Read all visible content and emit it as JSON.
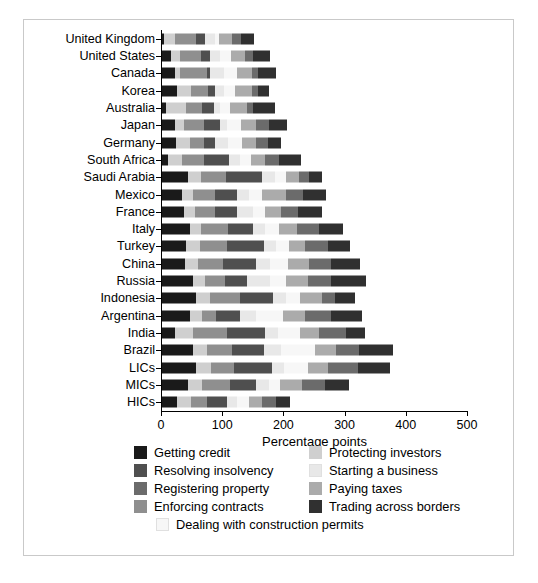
{
  "chart_data": {
    "type": "bar",
    "orientation": "horizontal",
    "stacked": true,
    "title": "",
    "xlabel": "Percentage points",
    "ylabel": "",
    "xlim": [
      0,
      520
    ],
    "xticks": [
      0,
      100,
      200,
      300,
      400,
      500
    ],
    "grid": false,
    "legend_position": "below",
    "categories": [
      "United Kingdom",
      "United States",
      "Canada",
      "Korea",
      "Australia",
      "Japan",
      "Germany",
      "South Africa",
      "Saudi Arabia",
      "Mexico",
      "France",
      "Italy",
      "Turkey",
      "China",
      "Russia",
      "Indonesia",
      "Argentina",
      "India",
      "Brazil",
      "LICs",
      "MICs",
      "HICs"
    ],
    "series": [
      {
        "name": "Getting credit",
        "color": "#1a1a1a",
        "values": [
          4,
          14,
          22,
          24,
          6,
          22,
          23,
          10,
          42,
          33,
          36,
          45,
          40,
          37,
          50,
          55,
          46,
          22,
          50,
          56,
          43,
          24
        ]
      },
      {
        "name": "Protecting investors",
        "color": "#cfcfcf",
        "values": [
          18,
          16,
          8,
          24,
          34,
          14,
          23,
          22,
          22,
          17,
          18,
          18,
          22,
          22,
          20,
          23,
          20,
          28,
          24,
          24,
          22,
          23
        ]
      },
      {
        "name": "Enforcing contracts",
        "color": "#8f8f8f",
        "values": [
          33,
          33,
          43,
          27,
          25,
          32,
          22,
          36,
          40,
          36,
          33,
          45,
          44,
          40,
          33,
          49,
          22,
          56,
          40,
          37,
          46,
          27
        ]
      },
      {
        "name": "Resolving insolvency",
        "color": "#4f4f4f",
        "values": [
          16,
          16,
          6,
          12,
          20,
          26,
          18,
          42,
          60,
          36,
          35,
          40,
          60,
          54,
          36,
          54,
          40,
          62,
          52,
          62,
          42,
          33
        ]
      },
      {
        "name": "Starting a business",
        "color": "#e8e8e8",
        "values": [
          16,
          16,
          22,
          14,
          10,
          13,
          22,
          17,
          20,
          20,
          26,
          20,
          20,
          23,
          38,
          22,
          25,
          22,
          28,
          20,
          22,
          15
        ]
      },
      {
        "name": "Dealing with construction permits",
        "color": "#f7f7f7",
        "values": [
          6,
          18,
          22,
          18,
          16,
          22,
          22,
          18,
          18,
          22,
          20,
          24,
          22,
          30,
          26,
          22,
          44,
          36,
          56,
          40,
          18,
          20
        ]
      },
      {
        "name": "Paying taxes",
        "color": "#ababab",
        "values": [
          22,
          22,
          24,
          28,
          28,
          24,
          24,
          24,
          22,
          38,
          26,
          28,
          26,
          34,
          36,
          36,
          36,
          30,
          34,
          32,
          36,
          22
        ]
      },
      {
        "name": "Registering property",
        "color": "#6b6b6b",
        "values": [
          14,
          14,
          10,
          10,
          10,
          22,
          20,
          22,
          16,
          28,
          28,
          36,
          38,
          36,
          38,
          22,
          44,
          44,
          38,
          50,
          38,
          22
        ]
      },
      {
        "name": "Trading across borders",
        "color": "#303030",
        "values": [
          22,
          28,
          30,
          18,
          35,
          30,
          20,
          36,
          22,
          38,
          40,
          40,
          36,
          48,
          56,
          32,
          50,
          32,
          55,
          52,
          38,
          24
        ]
      }
    ],
    "segment_order": [
      "Getting credit",
      "Protecting investors",
      "Enforcing contracts",
      "Resolving insolvency",
      "Starting a business",
      "Dealing with construction permits",
      "Paying taxes",
      "Registering property",
      "Trading across borders"
    ]
  },
  "axis": {
    "x_title": "Percentage points",
    "x_tick_labels": [
      "0",
      "100",
      "200",
      "300",
      "400",
      "500"
    ]
  },
  "legend": {
    "rows": [
      [
        {
          "label": "Getting credit",
          "color": "#1a1a1a",
          "pale": false
        },
        {
          "label": "Protecting investors",
          "color": "#cfcfcf",
          "pale": false
        }
      ],
      [
        {
          "label": "Resolving insolvency",
          "color": "#4f4f4f",
          "pale": false
        },
        {
          "label": "Starting a business",
          "color": "#e8e8e8",
          "pale": true
        }
      ],
      [
        {
          "label": "Registering property",
          "color": "#6b6b6b",
          "pale": false
        },
        {
          "label": "Paying taxes",
          "color": "#ababab",
          "pale": false
        }
      ],
      [
        {
          "label": "Enforcing contracts",
          "color": "#8f8f8f",
          "pale": false
        },
        {
          "label": "Trading across borders",
          "color": "#303030",
          "pale": false
        }
      ]
    ],
    "single": {
      "label": "Dealing with construction permits",
      "color": "#f7f7f7",
      "pale": true
    }
  }
}
